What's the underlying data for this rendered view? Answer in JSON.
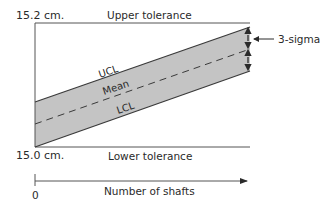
{
  "diagram": {
    "labels": {
      "top_value": "15.2 cm.",
      "bottom_value": "15.0 cm.",
      "upper_tolerance": "Upper tolerance",
      "lower_tolerance": "Lower tolerance",
      "ucl": "UCL",
      "mean": "Mean",
      "lcl": "LCL",
      "sigma": "3-sigma",
      "x_origin": "0",
      "x_axis": "Number of shafts"
    },
    "colors": {
      "band_fill": "#c4c4c4",
      "line": "#3a3a3a",
      "text": "#2a2a2a"
    }
  }
}
